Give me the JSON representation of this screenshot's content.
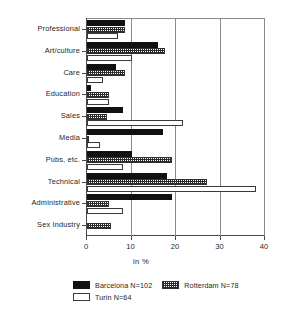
{
  "chart_data": {
    "type": "bar",
    "orientation": "horizontal",
    "title": "",
    "xlabel": "in %",
    "ylabel": "",
    "xlim": [
      0,
      40
    ],
    "xticks": [
      0,
      10,
      20,
      30,
      40
    ],
    "xtick_labels": [
      "0",
      "10",
      "20",
      "30",
      "40"
    ],
    "grid": true,
    "grid_axis": "x",
    "legend_position": "bottom",
    "categories": [
      "Professional",
      "Art/culture",
      "Care",
      "Education",
      "Sales",
      "Media",
      "Pubs, etc.",
      "Technical",
      "Administrative",
      "Sex Industry"
    ],
    "series": [
      {
        "name": "Barcelona N=102",
        "short_name": "Barcelona",
        "n": 102,
        "fill": "solid-black",
        "color": "#111111",
        "values": [
          8.5,
          16.0,
          6.5,
          1.0,
          8.0,
          17.0,
          10.0,
          18.0,
          19.0,
          0.0
        ]
      },
      {
        "name": "Rotterdam N=78",
        "short_name": "Rotterdam",
        "n": 78,
        "fill": "stippled",
        "color": "#2b2b2b",
        "values": [
          8.5,
          17.5,
          8.5,
          5.0,
          4.5,
          0.5,
          19.0,
          27.0,
          5.0,
          5.5
        ]
      },
      {
        "name": "Turin N=64",
        "short_name": "Turin",
        "n": 64,
        "fill": "white",
        "color": "#ffffff",
        "values": [
          7.0,
          10.0,
          3.5,
          5.0,
          21.5,
          3.0,
          8.0,
          38.0,
          8.0,
          0.0
        ]
      }
    ]
  },
  "legend": {
    "items": [
      {
        "label": "Barcelona N=102",
        "swatch": "solid-black-swatch"
      },
      {
        "label": "Rotterdam N=78",
        "swatch": "stippled-swatch"
      },
      {
        "label": "Turin N=64",
        "swatch": "white-swatch"
      }
    ]
  },
  "axis": {
    "x_title": "in %"
  }
}
